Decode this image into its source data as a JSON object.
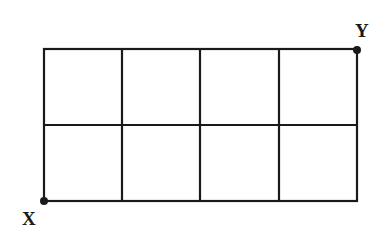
{
  "diagram": {
    "type": "grid",
    "rows": 2,
    "cols": 4,
    "grid_box": {
      "x1": 44,
      "y1": 49,
      "x2": 357,
      "y2": 201
    },
    "line_color": "#1a1a1a",
    "points": [
      {
        "id": "X",
        "label": "X",
        "position": "bottom-left corner",
        "x": 44,
        "y": 201
      },
      {
        "id": "Y",
        "label": "Y",
        "position": "top-right corner",
        "x": 357,
        "y": 49
      }
    ]
  },
  "labels": {
    "x": "X",
    "y": "Y"
  }
}
